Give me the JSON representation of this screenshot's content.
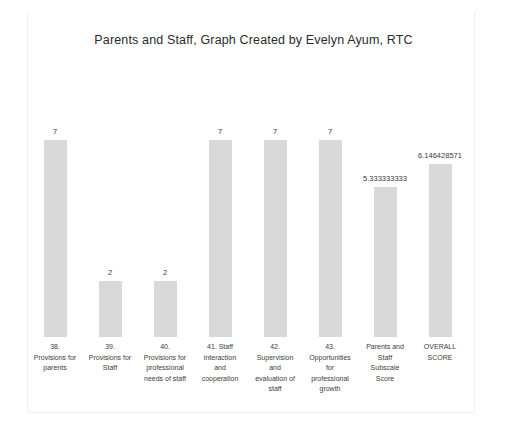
{
  "chart_data": {
    "type": "bar",
    "title": "Parents and Staff, Graph Created by Evelyn Ayum, RTC",
    "xlabel": "",
    "ylabel": "",
    "ylim": [
      0,
      7
    ],
    "grid": false,
    "legend": "none",
    "bar_color": "#d9d9d9",
    "background_color": "#ffffff",
    "categories": [
      "38. Provisions for parents",
      "39. Provisions for Staff",
      "40. Provisions for professional needs of staff",
      "41. Staff interaction and cooperation",
      "42. Supervision and evaluation of staff",
      "43. Opportunities for professional growth",
      "Parents and Staff Subscale Score",
      "OVERALL SCORE"
    ],
    "values": [
      7,
      2,
      2,
      7,
      7,
      7,
      5.333333333,
      6.146428571
    ],
    "value_labels": [
      "7",
      "2",
      "2",
      "7",
      "7",
      "7",
      "5.333333333",
      "6.146428571"
    ],
    "category_lines": [
      [
        "38.",
        "Provisions for",
        "parents"
      ],
      [
        "39.",
        "Provisions for",
        "Staff"
      ],
      [
        "40.",
        "Provisions for",
        "professional",
        "needs of staff"
      ],
      [
        "41.  Staff",
        "interaction",
        "and",
        "cooperation"
      ],
      [
        "42.",
        "Supervision",
        "and",
        "evaluation of",
        "staff"
      ],
      [
        "43.",
        "Opportunities",
        "for",
        "professional",
        "growth"
      ],
      [
        "Parents and",
        "Staff",
        "Subscale",
        "Score"
      ],
      [
        "OVERALL",
        "SCORE"
      ]
    ]
  }
}
